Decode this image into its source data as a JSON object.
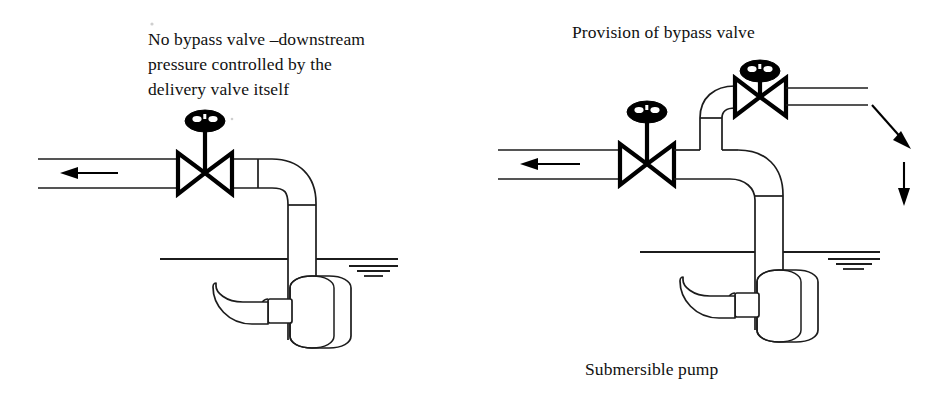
{
  "figure": {
    "title_left": "No bypass valve –downstream pressure controlled by the delivery valve itself",
    "title_right": "Provision of bypass valve",
    "caption_bottom": "Submersible pump",
    "line_color": "#1c1c1c",
    "valve_color": "#000000",
    "background": "#ffffff"
  },
  "labels": {
    "left_line_1": "No bypass valve –downstream",
    "left_line_2": "pressure controlled by the",
    "left_line_3": "delivery valve itself",
    "right_line_1": "Provision of bypass valve",
    "bottom_caption": "Submersible pump"
  },
  "left_diagram": {
    "name": "no-bypass-valve-arrangement",
    "components": [
      {
        "id": "delivery-pipe-horizontal",
        "type": "pipe",
        "orientation": "horizontal"
      },
      {
        "id": "flow-arrow",
        "type": "arrow",
        "direction": "left"
      },
      {
        "id": "delivery-valve",
        "type": "gate-valve",
        "has_handwheel": true
      },
      {
        "id": "pipe-elbow",
        "type": "elbow",
        "turn": "down"
      },
      {
        "id": "riser-pipe",
        "type": "pipe",
        "orientation": "vertical"
      },
      {
        "id": "water-level",
        "type": "water-surface"
      },
      {
        "id": "submersible-pump",
        "type": "pump"
      },
      {
        "id": "pump-suction-intake",
        "type": "intake"
      }
    ]
  },
  "right_diagram": {
    "name": "bypass-valve-arrangement",
    "components": [
      {
        "id": "delivery-pipe-horizontal",
        "type": "pipe",
        "orientation": "horizontal"
      },
      {
        "id": "flow-arrow",
        "type": "arrow",
        "direction": "left"
      },
      {
        "id": "delivery-valve",
        "type": "gate-valve",
        "has_handwheel": true
      },
      {
        "id": "bypass-tee",
        "type": "tee-junction"
      },
      {
        "id": "bypass-riser",
        "type": "pipe",
        "orientation": "vertical"
      },
      {
        "id": "bypass-elbow",
        "type": "elbow",
        "turn": "right"
      },
      {
        "id": "bypass-valve",
        "type": "gate-valve",
        "has_handwheel": true
      },
      {
        "id": "bypass-outlet-pipe",
        "type": "pipe",
        "orientation": "horizontal"
      },
      {
        "id": "discharge-arrow-diagonal",
        "type": "arrow",
        "direction": "down-right"
      },
      {
        "id": "discharge-arrow-vertical",
        "type": "arrow",
        "direction": "down"
      },
      {
        "id": "main-elbow",
        "type": "elbow",
        "turn": "down"
      },
      {
        "id": "riser-pipe",
        "type": "pipe",
        "orientation": "vertical"
      },
      {
        "id": "water-level",
        "type": "water-surface"
      },
      {
        "id": "submersible-pump",
        "type": "pump"
      },
      {
        "id": "pump-suction-intake",
        "type": "intake"
      }
    ]
  }
}
